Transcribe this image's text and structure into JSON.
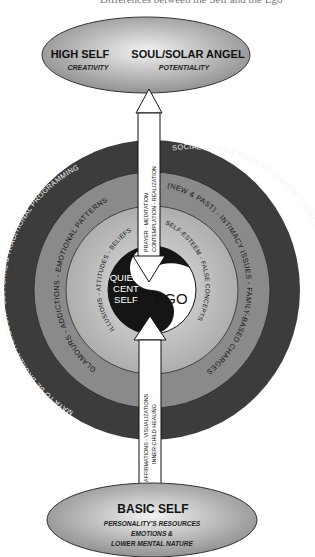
{
  "header_fragment": "Differences between the Self and the Ego",
  "top_ellipse": {
    "left_title": "HIGH SELF",
    "left_subtitle": "CREATIVITY",
    "right_title": "SOUL/SOLAR ANGEL",
    "right_subtitle": "POTENTIALITY"
  },
  "upper_arrow": {
    "line1": "PRAYER - MEDITATION",
    "line2": "CONTEMPLATION - REALIZATION"
  },
  "rings": {
    "outer": {
      "top_left": "MAYA TO BE BROKEN THROUGH - CULTURAL & TRADITIONAL PROGRAMMING",
      "top_right": "SOCIAL IMPRINT FROM EDUCATION, CHURCH, & ENVIRONMENT COLLECTIVE",
      "color": "#3c3c3c"
    },
    "middle": {
      "left": "GLAMOURS - ADDICTIONS - EMOTIONAL PATTERNS",
      "right": "(NEW & PAST) - INTIMACY ISSUES - FAMILY-BASED CHARGES",
      "color": "#8a8a8a"
    },
    "inner": {
      "left": "ILLUSIONS - ATTITUDES - BELIEFS",
      "right": "SELF-ESTEEM - FALSE CONCEPTS",
      "color": "#b4b4b4"
    }
  },
  "core": {
    "dark_label_1": "QUIES-",
    "dark_label_2": "CENT",
    "dark_label_3": "SELF",
    "light_label": "EGO"
  },
  "lower_arrow": {
    "line1": "AFFIRMATIONS - VISUALIZATIONS",
    "line2": "INNER-CHILD HEALING"
  },
  "bottom_ellipse": {
    "title": "BASIC SELF",
    "line1": "PERSONALITY'S RESOURCES",
    "line2": "EMOTIONS &",
    "line3": "LOWER MENTAL NATURE"
  }
}
